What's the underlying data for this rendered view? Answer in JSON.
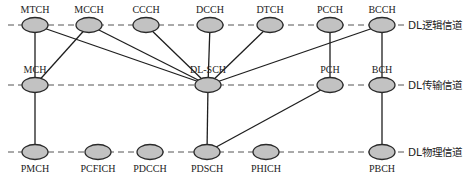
{
  "layers": [
    {
      "id": "logical",
      "label": "DL逻辑信道",
      "y": 25
    },
    {
      "id": "transport",
      "label": "DL传输信道",
      "y": 85
    },
    {
      "id": "physical",
      "label": "DL物理信道",
      "y": 152
    }
  ],
  "nodes": {
    "logical": [
      {
        "id": "MTCH",
        "label": "MTCH",
        "x": 35
      },
      {
        "id": "MCCH",
        "label": "MCCH",
        "x": 89
      },
      {
        "id": "CCCH",
        "label": "CCCH",
        "x": 146
      },
      {
        "id": "DCCH",
        "label": "DCCH",
        "x": 210
      },
      {
        "id": "DTCH",
        "label": "DTCH",
        "x": 270
      },
      {
        "id": "PCCH",
        "label": "PCCH",
        "x": 330
      },
      {
        "id": "BCCH",
        "label": "BCCH",
        "x": 382
      }
    ],
    "transport": [
      {
        "id": "MCH",
        "label": "MCH",
        "x": 35
      },
      {
        "id": "DLSCH",
        "label": "DL-SCH",
        "x": 208
      },
      {
        "id": "PCH",
        "label": "PCH",
        "x": 330
      },
      {
        "id": "BCH",
        "label": "BCH",
        "x": 382
      }
    ],
    "physical": [
      {
        "id": "PMCH",
        "label": "PMCH",
        "x": 35
      },
      {
        "id": "PCFICH",
        "label": "PCFICH",
        "x": 98
      },
      {
        "id": "PDCCH",
        "label": "PDCCH",
        "x": 150
      },
      {
        "id": "PDSCH",
        "label": "PDSCH",
        "x": 207
      },
      {
        "id": "PHICH",
        "label": "PHICH",
        "x": 266
      },
      {
        "id": "PBCH",
        "label": "PBCH",
        "x": 382
      }
    ]
  },
  "edges": [
    [
      "MTCH",
      "MCH"
    ],
    [
      "MTCH",
      "DLSCH"
    ],
    [
      "MCCH",
      "MCH"
    ],
    [
      "MCCH",
      "DLSCH"
    ],
    [
      "CCCH",
      "DLSCH"
    ],
    [
      "DCCH",
      "DLSCH"
    ],
    [
      "DTCH",
      "DLSCH"
    ],
    [
      "BCCH",
      "DLSCH"
    ],
    [
      "BCCH",
      "BCH"
    ],
    [
      "PCCH",
      "PCH"
    ],
    [
      "MCH",
      "PMCH"
    ],
    [
      "DLSCH",
      "PDSCH"
    ],
    [
      "PCH",
      "PDSCH"
    ],
    [
      "BCH",
      "PBCH"
    ]
  ],
  "colors": {
    "node_fill": "#c2c2c2",
    "node_stroke": "#2a2a2a",
    "edge": "#1e1e1e",
    "dashed_line": "#555555"
  }
}
